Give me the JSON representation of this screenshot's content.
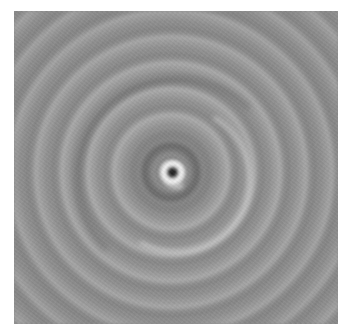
{
  "image": {
    "description": "Grayscale concentric ring pattern with a bright swirled core and dark center point",
    "subject": "concentric-rings",
    "colors": {
      "background": "#ffffff",
      "base_gray": "#8f8f8f",
      "light_ring": "#a6a6a6",
      "dark_ring": "#7e7e7e",
      "core_bright": "#f2f2f2",
      "core_dark": "#1a1a1a"
    },
    "frame": {
      "left": 14,
      "top": 11,
      "width": 324,
      "height": 313
    },
    "center": {
      "x": 171,
      "y": 172
    }
  }
}
